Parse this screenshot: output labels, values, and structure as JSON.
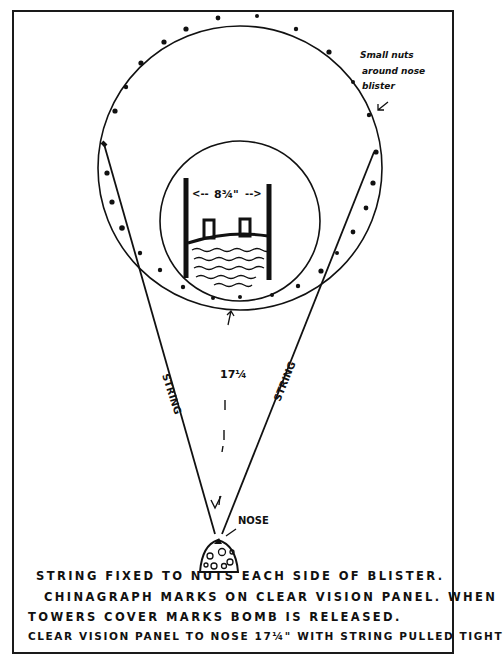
{
  "diagram": {
    "labels": {
      "outer_note_line1": "Small nuts",
      "outer_note_line2": "around nose",
      "outer_note_line3": "blister",
      "width_dimension": "8¾\"",
      "width_dim_left": "<--",
      "width_dim_right": "-->",
      "distance_dimension": "17¼",
      "string_left": "STRING",
      "string_right": "STRING",
      "nose": "NOSE"
    },
    "notes": [
      "STRING FIXED TO NUTS EACH SIDE OF BLISTER.",
      "CHINAGRAPH MARKS ON CLEAR VISION PANEL. WHEN",
      "TOWERS COVER MARKS BOMB IS RELEASED.",
      "CLEAR VISION PANEL TO NOSE 17¼\" WITH STRING PULLED TIGHT"
    ],
    "colors": {
      "ink": "#111111",
      "paper": "#ffffff"
    }
  }
}
